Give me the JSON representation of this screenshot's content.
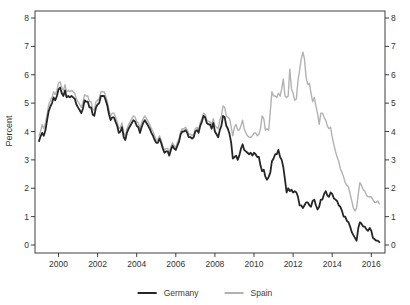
{
  "figure": {
    "background": "#ffffff",
    "frame_color": "#2a2a2a"
  },
  "chart_data": {
    "type": "line",
    "title": "",
    "xlabel": "",
    "ylabel": "Percent",
    "grid": false,
    "legend_position": "bottom-center",
    "x_start_year": 1999.0,
    "x_step_years": 0.0833333,
    "x_end_label": "mid-2016",
    "x_ticks": [
      2000,
      2002,
      2004,
      2006,
      2008,
      2010,
      2012,
      2014,
      2016
    ],
    "y_ticks": [
      0,
      1,
      2,
      3,
      4,
      5,
      6,
      7,
      8
    ],
    "ylim": [
      0,
      8
    ],
    "dual_y_axis_labels": true,
    "series": [
      {
        "name": "Spain",
        "color": "#b2b2b2",
        "width": 1.4,
        "values": [
          3.85,
          4.0,
          4.25,
          4.1,
          4.3,
          4.6,
          4.95,
          5.1,
          5.2,
          5.4,
          5.3,
          5.45,
          5.7,
          5.75,
          5.55,
          5.45,
          5.65,
          5.4,
          5.45,
          5.4,
          5.45,
          5.4,
          5.35,
          5.15,
          5.05,
          4.95,
          4.85,
          5.0,
          5.3,
          5.25,
          5.25,
          5.05,
          5.05,
          4.8,
          4.75,
          5.05,
          5.1,
          5.15,
          5.4,
          5.4,
          5.4,
          5.25,
          5.05,
          4.75,
          4.55,
          4.65,
          4.65,
          4.5,
          4.35,
          4.1,
          4.15,
          4.3,
          3.95,
          3.85,
          4.1,
          4.25,
          4.35,
          4.45,
          4.55,
          4.5,
          4.35,
          4.3,
          4.1,
          4.3,
          4.45,
          4.55,
          4.45,
          4.35,
          4.25,
          4.1,
          4.0,
          3.85,
          3.7,
          3.7,
          3.85,
          3.7,
          3.5,
          3.35,
          3.4,
          3.4,
          3.25,
          3.45,
          3.6,
          3.5,
          3.45,
          3.6,
          3.75,
          4.0,
          4.1,
          4.1,
          4.15,
          4.05,
          3.9,
          3.9,
          3.85,
          3.9,
          4.1,
          4.15,
          4.05,
          4.3,
          4.45,
          4.65,
          4.6,
          4.4,
          4.35,
          4.35,
          4.25,
          4.45,
          4.2,
          4.15,
          4.1,
          4.4,
          4.55,
          4.9,
          4.85,
          4.55,
          4.5,
          4.45,
          4.15,
          3.85,
          4.15,
          4.25,
          4.05,
          4.05,
          4.2,
          4.4,
          4.1,
          3.95,
          3.85,
          3.8,
          3.8,
          3.85,
          3.95,
          3.95,
          3.85,
          3.9,
          4.1,
          4.55,
          4.45,
          4.05,
          4.1,
          4.05,
          4.7,
          5.4,
          5.25,
          5.25,
          5.2,
          5.35,
          5.25,
          5.5,
          5.85,
          5.25,
          5.2,
          5.25,
          6.2,
          5.5,
          5.35,
          5.1,
          5.15,
          5.8,
          6.15,
          6.55,
          6.8,
          6.55,
          5.9,
          5.65,
          5.7,
          5.35,
          5.05,
          5.2,
          4.9,
          4.65,
          4.25,
          4.65,
          4.65,
          4.5,
          4.4,
          4.2,
          4.1,
          4.15,
          3.8,
          3.55,
          3.3,
          3.1,
          2.95,
          2.7,
          2.55,
          2.4,
          2.2,
          2.1,
          2.05,
          1.8,
          1.55,
          1.3,
          1.2,
          1.3,
          1.8,
          2.2,
          2.1,
          1.95,
          1.9,
          1.75,
          1.7,
          1.7,
          1.7,
          1.6,
          1.5,
          1.5,
          1.55,
          1.45
        ]
      },
      {
        "name": "Germany",
        "color": "#262626",
        "width": 1.8,
        "values": [
          3.66,
          3.83,
          3.95,
          3.85,
          4.05,
          4.4,
          4.72,
          4.88,
          5.0,
          5.2,
          5.1,
          5.25,
          5.48,
          5.55,
          5.35,
          5.25,
          5.45,
          5.2,
          5.25,
          5.2,
          5.25,
          5.2,
          5.15,
          4.95,
          4.85,
          4.75,
          4.65,
          4.8,
          5.1,
          5.05,
          5.05,
          4.85,
          4.85,
          4.6,
          4.55,
          4.85,
          4.95,
          5.0,
          5.25,
          5.25,
          5.25,
          5.1,
          4.9,
          4.6,
          4.4,
          4.5,
          4.5,
          4.35,
          4.2,
          3.95,
          4.0,
          4.15,
          3.8,
          3.7,
          3.95,
          4.1,
          4.2,
          4.3,
          4.4,
          4.35,
          4.2,
          4.15,
          3.95,
          4.15,
          4.3,
          4.4,
          4.3,
          4.2,
          4.1,
          3.95,
          3.85,
          3.7,
          3.6,
          3.6,
          3.75,
          3.6,
          3.4,
          3.25,
          3.3,
          3.3,
          3.15,
          3.35,
          3.5,
          3.4,
          3.35,
          3.5,
          3.65,
          3.9,
          4.0,
          4.0,
          4.05,
          3.95,
          3.8,
          3.8,
          3.75,
          3.8,
          4.0,
          4.05,
          3.95,
          4.2,
          4.35,
          4.55,
          4.5,
          4.3,
          4.25,
          4.25,
          4.1,
          4.3,
          4.0,
          3.9,
          3.8,
          4.05,
          4.2,
          4.55,
          4.5,
          4.2,
          4.1,
          3.9,
          3.6,
          3.05,
          3.1,
          3.15,
          3.0,
          3.15,
          3.4,
          3.55,
          3.35,
          3.3,
          3.25,
          3.2,
          3.25,
          3.15,
          3.25,
          3.2,
          3.1,
          3.1,
          2.8,
          2.6,
          2.65,
          2.4,
          2.3,
          2.4,
          2.55,
          2.95,
          3.05,
          3.2,
          3.2,
          3.35,
          3.1,
          3.0,
          2.75,
          2.3,
          1.85,
          2.0,
          1.9,
          1.95,
          1.85,
          1.9,
          1.85,
          1.7,
          1.4,
          1.4,
          1.3,
          1.4,
          1.5,
          1.5,
          1.4,
          1.35,
          1.55,
          1.6,
          1.4,
          1.25,
          1.35,
          1.6,
          1.6,
          1.8,
          1.9,
          1.75,
          1.7,
          1.85,
          1.8,
          1.65,
          1.6,
          1.55,
          1.4,
          1.35,
          1.2,
          1.0,
          1.0,
          0.85,
          0.8,
          0.65,
          0.45,
          0.35,
          0.25,
          0.15,
          0.6,
          0.8,
          0.75,
          0.65,
          0.65,
          0.55,
          0.5,
          0.6,
          0.5,
          0.25,
          0.2,
          0.15,
          0.15,
          0.1
        ]
      }
    ],
    "legend_order": [
      "Germany",
      "Spain"
    ]
  }
}
